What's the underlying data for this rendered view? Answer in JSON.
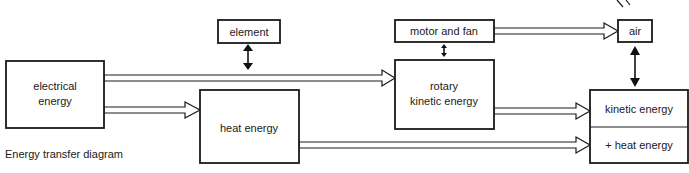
{
  "diagram": {
    "caption": "Energy transfer diagram",
    "nodes": {
      "electrical": {
        "line1": "electrical",
        "line2": "energy"
      },
      "element": {
        "label": "element"
      },
      "heat": {
        "label": "heat energy"
      },
      "motor": {
        "label": "motor and fan"
      },
      "rotary": {
        "line1": "rotary",
        "line2": "kinetic energy"
      },
      "air": {
        "label": "air"
      },
      "output": {
        "top": "kinetic energy",
        "bottom": "+ heat energy"
      }
    },
    "edges": [
      {
        "from": "electrical energy",
        "to": "rotary kinetic energy",
        "type": "transfer-arrow"
      },
      {
        "from": "electrical energy",
        "to": "heat energy",
        "type": "transfer-arrow"
      },
      {
        "from": "motor and fan",
        "to": "air",
        "type": "transfer-arrow"
      },
      {
        "from": "rotary kinetic energy",
        "to": "kinetic energy",
        "type": "transfer-arrow"
      },
      {
        "from": "heat energy",
        "to": "+ heat energy",
        "type": "transfer-arrow"
      },
      {
        "between": [
          "element",
          "electrical-to-rotary pipe"
        ],
        "type": "double-arrow"
      },
      {
        "between": [
          "motor and fan",
          "rotary kinetic energy"
        ],
        "type": "double-arrow"
      },
      {
        "between": [
          "air",
          "kinetic energy"
        ],
        "type": "double-arrow"
      }
    ]
  }
}
